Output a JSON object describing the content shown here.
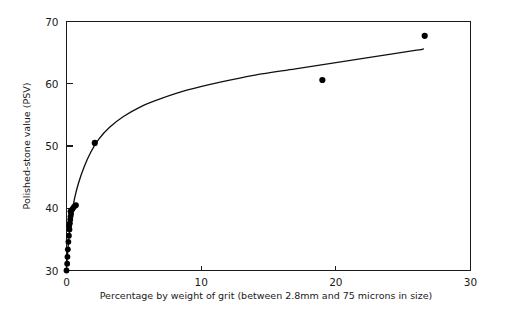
{
  "chart_data": {
    "type": "scatter",
    "title": "",
    "subtitle": "",
    "xlabel": "Percentage by weight of grit (between 2.8mm and 75 microns in size)",
    "ylabel": "Polished-stone value (PSV)",
    "xlim": [
      0,
      30
    ],
    "ylim": [
      30,
      70
    ],
    "xticks": [
      0,
      10,
      20,
      30
    ],
    "xticklabels": [
      "0",
      "10",
      "20",
      "30"
    ],
    "yticks": [
      30,
      40,
      50,
      60,
      70
    ],
    "yticklabels": [
      "30",
      "40",
      "50",
      "60",
      "70"
    ],
    "grid": false,
    "legend": false,
    "legend_position": "none",
    "series": [
      {
        "name": "Observed samples",
        "marker": "filled-circle",
        "color": "#000000",
        "points": [
          {
            "x": 0.0,
            "y": 30.0
          },
          {
            "x": 0.05,
            "y": 31.1
          },
          {
            "x": 0.07,
            "y": 32.2
          },
          {
            "x": 0.1,
            "y": 33.4
          },
          {
            "x": 0.14,
            "y": 34.6
          },
          {
            "x": 0.18,
            "y": 35.6
          },
          {
            "x": 0.22,
            "y": 36.6
          },
          {
            "x": 0.2,
            "y": 37.2
          },
          {
            "x": 0.25,
            "y": 37.6
          },
          {
            "x": 0.28,
            "y": 38.2
          },
          {
            "x": 0.3,
            "y": 38.7
          },
          {
            "x": 0.34,
            "y": 39.1
          },
          {
            "x": 0.3,
            "y": 39.5
          },
          {
            "x": 0.38,
            "y": 39.7
          },
          {
            "x": 0.45,
            "y": 39.9
          },
          {
            "x": 0.55,
            "y": 40.2
          },
          {
            "x": 0.7,
            "y": 40.5
          },
          {
            "x": 2.1,
            "y": 50.5
          },
          {
            "x": 19.0,
            "y": 60.6
          },
          {
            "x": 26.6,
            "y": 67.7
          }
        ]
      }
    ],
    "fit_curve": {
      "name": "Fitted trend",
      "color": "#111111",
      "points": [
        {
          "x": 0.0,
          "y": 30.0
        },
        {
          "x": 0.15,
          "y": 34.6
        },
        {
          "x": 0.35,
          "y": 38.6
        },
        {
          "x": 0.6,
          "y": 41.6
        },
        {
          "x": 0.9,
          "y": 44.1
        },
        {
          "x": 1.3,
          "y": 46.6
        },
        {
          "x": 1.8,
          "y": 49.0
        },
        {
          "x": 2.4,
          "y": 51.1
        },
        {
          "x": 3.2,
          "y": 53.0
        },
        {
          "x": 4.2,
          "y": 54.7
        },
        {
          "x": 5.5,
          "y": 56.3
        },
        {
          "x": 7.0,
          "y": 57.6
        },
        {
          "x": 9.0,
          "y": 59.0
        },
        {
          "x": 11.5,
          "y": 60.3
        },
        {
          "x": 14.0,
          "y": 61.4
        },
        {
          "x": 17.0,
          "y": 62.4
        },
        {
          "x": 20.0,
          "y": 63.4
        },
        {
          "x": 23.0,
          "y": 64.4
        },
        {
          "x": 26.0,
          "y": 65.4
        },
        {
          "x": 26.5,
          "y": 65.6
        }
      ]
    }
  },
  "axes": {
    "y_axis_title": "Polished-stone value (PSV)",
    "x_axis_title": "Percentage by weight of grit (between 2.8mm and 75 microns in size)"
  }
}
